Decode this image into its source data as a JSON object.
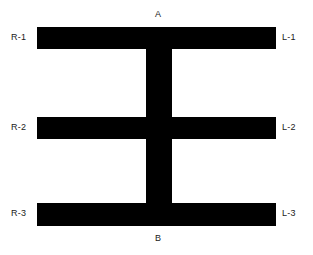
{
  "figure": {
    "background_color": "#ffffff",
    "shape_color": "#000000",
    "width": 313,
    "height": 255,
    "labels": {
      "top": "A",
      "bottom": "B",
      "left": [
        "R-1",
        "R-2",
        "R-3"
      ],
      "right": [
        "L-1",
        "L-2",
        "L-3"
      ]
    },
    "geometry": {
      "horizontal_bars": [
        {
          "name": "bar-top",
          "x": 37,
          "y": 27,
          "width": 239,
          "height": 22
        },
        {
          "name": "bar-middle",
          "x": 37,
          "y": 117,
          "width": 239,
          "height": 22
        },
        {
          "name": "bar-bottom",
          "x": 37,
          "y": 203,
          "width": 239,
          "height": 23
        }
      ],
      "vertical_bar": {
        "name": "spine",
        "x": 146,
        "y": 27,
        "width": 26,
        "height": 199
      }
    }
  }
}
